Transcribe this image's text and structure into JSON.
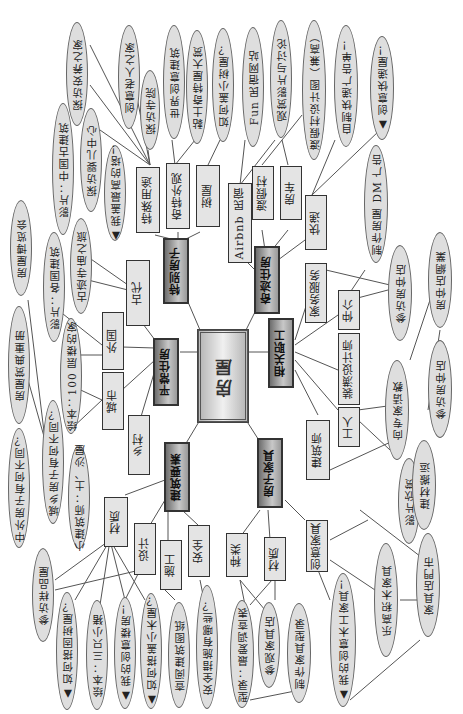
{
  "title": "房屋",
  "hubs": [
    {
      "id": "h1",
      "label": "特别房子"
    },
    {
      "id": "h2",
      "label": "奇迹住房"
    },
    {
      "id": "h3",
      "label": "平常住房"
    },
    {
      "id": "h4",
      "label": "相关职工"
    },
    {
      "id": "h5",
      "label": "建筑要素"
    },
    {
      "id": "h6",
      "label": "房子家具"
    }
  ],
  "boxes": {
    "b_tsyt": "特殊用途",
    "b_qtwg": "奇特外观",
    "b_sw": "树屋",
    "b_airbnb": "Airbnb 民宿",
    "b_djc": "渡假村",
    "b_fc": "房车",
    "b_kz": "快递",
    "b_gd": "古代",
    "b_wg": "外国",
    "b_cs": "城市",
    "b_xc": "乡村",
    "b_jzfw": "家务服务",
    "b_zj": "仲介",
    "b_zxsjs": "装潢设计师",
    "b_gr": "工人",
    "b_jzs": "建筑师",
    "b_cz": "材质",
    "b_sj": "设计",
    "b_sg": "施工",
    "b_aq": "安全",
    "b_zl": "种类",
    "b_cz2": "材质",
    "b_cyjj": "创意家具"
  },
  "ovals": {
    "o_tfaqzj": "探访安养之家",
    "o_cylrzj": "创意老人之家",
    "o_tfsy": "探访寺院",
    "o_sjcyjz": "世界创意建筑",
    "o_ntqtwdm": "黏土奇特屋大赏",
    "o_rhgxsw": "如何盖小树屋？",
    "o_funmsnz": "Fun 民宿网站",
    "o_gsyptl": "观赏影片与讨论",
    "o_djcsjt": "渡假村设计图（兼高）",
    "o_zzkdgz": "自制快递广告单！",
    "o_cykdw": "▲ 创意快递屋！",
    "o_zzfwdm": "制作房屋 DM 广告",
    "o_ypzggjz": "影片：中国古建筑",
    "o_tfyezx": "探访婴儿中心",
    "o_wgzgdt": "▲ 我盖最高的塔！",
    "o_fwblh": "房屋博览会",
    "o_ypgggjz": "影片：各国建筑",
    "o_gjsmzl": "古迹寺庙之旅",
    "o_fwsdqt": "房屋赏典重册",
    "o_hb100": "绘本：100 层楼的家",
    "o_zwfz": "中外房子有何不同？",
    "o_cxfz": "城乡房子有何不同？",
    "o_xjzs": "小建筑师：土、沙屋",
    "o_cfyp": "参访样品屋",
    "o_rhdgsw": "▲ 如何搭固树屋？",
    "o_hbsz": "绘本：三只小猪",
    "o_wdcylf": "▲ 我的创意楼房！",
    "o_rhdxmw": "▲ 如何搭盖小木屋？",
    "o_cyjztz": "查阅建筑图纸",
    "o_aqcs": "安全措施有哪些？",
    "o_xs": "型录：最爱调查表",
    "o_cgjjd": "参观家具店",
    "o_zzjjxl": "制作家具型录",
    "o_wdcymgjj": "▲ 我的创意木工家具！",
    "o_lgbmjj": "乐高积木家具",
    "o_jjdmt": "家具店門市",
    "o_ypxs": "影片欣赏",
    "o_jcbyn": "建材搬运",
    "o_xzjqf": "向专家请教",
    "o_cfzjd": "参访房仲店",
    "o_fzdwy": "房仲店網業",
    "o_cfzjd2": "参访房仲店"
  }
}
